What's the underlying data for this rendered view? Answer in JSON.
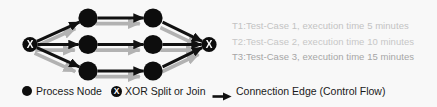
{
  "diagram": {
    "title_visible": false,
    "xor_glyph": "X",
    "node_count": 6,
    "gateway_count": 2,
    "edge_count": 9,
    "nodes": [
      {
        "id": "xor-split",
        "type": "xor",
        "cx": 30,
        "cy": 44.5,
        "r": 7.5,
        "label": "X"
      },
      {
        "id": "n1",
        "type": "process",
        "cx": 88,
        "cy": 18,
        "r": 9.5,
        "label": ""
      },
      {
        "id": "n2",
        "type": "process",
        "cx": 88,
        "cy": 44.5,
        "r": 9.5,
        "label": ""
      },
      {
        "id": "n3",
        "type": "process",
        "cx": 88,
        "cy": 71,
        "r": 9.5,
        "label": ""
      },
      {
        "id": "n4",
        "type": "process",
        "cx": 153,
        "cy": 18,
        "r": 9.5,
        "label": ""
      },
      {
        "id": "n5",
        "type": "process",
        "cx": 153,
        "cy": 44.5,
        "r": 9.5,
        "label": ""
      },
      {
        "id": "n6",
        "type": "process",
        "cx": 153,
        "cy": 71,
        "r": 9.5,
        "label": ""
      },
      {
        "id": "xor-join",
        "type": "xor",
        "cx": 209,
        "cy": 44.5,
        "r": 7.5,
        "label": "X"
      }
    ],
    "edges": [
      {
        "from": "xor-split",
        "to": "n1"
      },
      {
        "from": "xor-split",
        "to": "n2"
      },
      {
        "from": "xor-split",
        "to": "n3"
      },
      {
        "from": "n1",
        "to": "n4"
      },
      {
        "from": "n2",
        "to": "n5"
      },
      {
        "from": "n3",
        "to": "n6"
      },
      {
        "from": "n4",
        "to": "xor-join"
      },
      {
        "from": "n5",
        "to": "xor-join"
      },
      {
        "from": "n6",
        "to": "xor-join"
      }
    ]
  },
  "annotations": [
    {
      "id": "T1",
      "text": "T1:Test-Case 1, execution time 5 minutes",
      "color": "#c3c3c3"
    },
    {
      "id": "T2",
      "text": "T2:Test-Case 2, execution time 10 minutes",
      "color": "#c7c7c7"
    },
    {
      "id": "T3",
      "text": "T3:Test-Case 3, execution time 15 minutes",
      "color": "#a6a6a6"
    }
  ],
  "legend": {
    "items": [
      {
        "icon": "filled-circle-icon",
        "label": "Process Node"
      },
      {
        "icon": "xor-circle-icon",
        "label": "XOR Split or Join",
        "glyph": "X"
      },
      {
        "icon": "arrow-right-icon",
        "label": "Connection Edge (Control Flow)"
      }
    ]
  },
  "colors": {
    "background": "#f8f8f8",
    "node_fill": "#0d0d0d",
    "edge_black": "#111111",
    "edge_shadow_gray": "#b2b2b2",
    "legend_text": "#1a1a1a"
  }
}
